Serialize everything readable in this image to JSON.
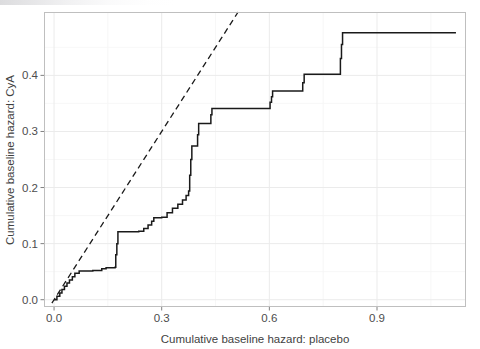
{
  "figure": {
    "width": 480,
    "height": 349,
    "background": "#ffffff",
    "panel": {
      "x": 44,
      "y": 12,
      "width": 422,
      "height": 295,
      "background": "#ffffff",
      "border_color": "#bfbfbf",
      "grid": {
        "major_color": "#ebebeb",
        "minor_color": "#f5f5f5",
        "enabled": true
      }
    }
  },
  "chart_data": {
    "type": "line",
    "title": "",
    "subtitle": "",
    "xlabel": "Cumulative baseline hazard: placebo",
    "ylabel": "Cumulative baseline hazard: CyA",
    "xlim": [
      -0.028,
      1.148
    ],
    "ylim": [
      -0.013,
      0.513
    ],
    "xticks": [
      0.0,
      0.3,
      0.6,
      0.9
    ],
    "xticklabels": [
      "0.0",
      "0.3",
      "0.6",
      "0.9"
    ],
    "yticks": [
      0.0,
      0.1,
      0.2,
      0.3,
      0.4
    ],
    "yticklabels": [
      "0.0",
      "0.1",
      "0.2",
      "0.3",
      "0.4"
    ],
    "xminorticks": [
      0.15,
      0.45,
      0.75,
      1.05
    ],
    "yminorticks": [
      0.05,
      0.15,
      0.25,
      0.35,
      0.45
    ],
    "grid": true,
    "legend": null,
    "series": [
      {
        "name": "step-curve",
        "type": "step",
        "style": "solid",
        "color": "#1a1a1a",
        "linewidth": 1.5,
        "points": [
          [
            0.0,
            0.0
          ],
          [
            0.008,
            0.006
          ],
          [
            0.016,
            0.012
          ],
          [
            0.022,
            0.018
          ],
          [
            0.029,
            0.024
          ],
          [
            0.036,
            0.03
          ],
          [
            0.043,
            0.035
          ],
          [
            0.051,
            0.041
          ],
          [
            0.058,
            0.047
          ],
          [
            0.07,
            0.051
          ],
          [
            0.083,
            0.051
          ],
          [
            0.096,
            0.051
          ],
          [
            0.108,
            0.052
          ],
          [
            0.12,
            0.052
          ],
          [
            0.133,
            0.055
          ],
          [
            0.145,
            0.057
          ],
          [
            0.158,
            0.057
          ],
          [
            0.17,
            0.058
          ],
          [
            0.172,
            0.08
          ],
          [
            0.175,
            0.1
          ],
          [
            0.178,
            0.121
          ],
          [
            0.21,
            0.121
          ],
          [
            0.236,
            0.122
          ],
          [
            0.25,
            0.127
          ],
          [
            0.262,
            0.133
          ],
          [
            0.272,
            0.14
          ],
          [
            0.278,
            0.146
          ],
          [
            0.29,
            0.146
          ],
          [
            0.3,
            0.147
          ],
          [
            0.315,
            0.155
          ],
          [
            0.33,
            0.163
          ],
          [
            0.345,
            0.17
          ],
          [
            0.358,
            0.178
          ],
          [
            0.368,
            0.186
          ],
          [
            0.375,
            0.194
          ],
          [
            0.378,
            0.222
          ],
          [
            0.381,
            0.25
          ],
          [
            0.384,
            0.274
          ],
          [
            0.398,
            0.274
          ],
          [
            0.4,
            0.294
          ],
          [
            0.403,
            0.314
          ],
          [
            0.435,
            0.314
          ],
          [
            0.437,
            0.33
          ],
          [
            0.44,
            0.341
          ],
          [
            0.6,
            0.341
          ],
          [
            0.602,
            0.352
          ],
          [
            0.606,
            0.362
          ],
          [
            0.609,
            0.372
          ],
          [
            0.69,
            0.372
          ],
          [
            0.693,
            0.387
          ],
          [
            0.697,
            0.402
          ],
          [
            0.795,
            0.402
          ],
          [
            0.798,
            0.43
          ],
          [
            0.801,
            0.455
          ],
          [
            0.804,
            0.476
          ],
          [
            1.12,
            0.476
          ]
        ]
      },
      {
        "name": "reference-diagonal",
        "type": "line",
        "style": "dashed",
        "color": "#1a1a1a",
        "linewidth": 1.3,
        "dasharray": "6,4",
        "points": [
          [
            -0.006,
            -0.006
          ],
          [
            0.513,
            0.513
          ]
        ]
      }
    ]
  },
  "axes": {
    "x_title": "Cumulative baseline hazard: placebo",
    "y_title": "Cumulative baseline hazard: CyA",
    "x_tick_labels": [
      "0.0",
      "0.3",
      "0.6",
      "0.9"
    ],
    "y_tick_labels": [
      "0.0",
      "0.1",
      "0.2",
      "0.3",
      "0.4"
    ],
    "tick_color": "#808080",
    "label_color": "#4d4d4d"
  },
  "artifacts": {
    "top_strip_note": "faint cropped text remnant along top-left edge"
  }
}
